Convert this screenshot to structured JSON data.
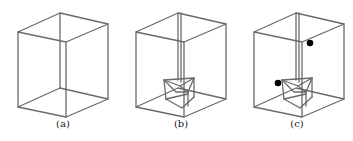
{
  "figure": {
    "panels": [
      {
        "id": "a",
        "label": "(a)",
        "description": "empty wireframe box"
      },
      {
        "id": "b",
        "label": "(b)",
        "description": "box with prism object at bottom connected by vertical rod"
      },
      {
        "id": "c",
        "label": "(c)",
        "description": "box with prism object and two black dots"
      }
    ],
    "colors": {
      "edge": "#6a6a6a",
      "dot": "#000000",
      "background": "#ffffff"
    }
  }
}
